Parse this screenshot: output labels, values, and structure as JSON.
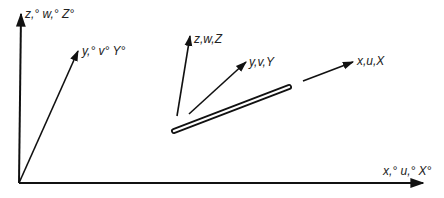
{
  "diagram": {
    "type": "coordinate-systems",
    "global_axes": {
      "z_label": "z,° w,° Z°",
      "y_label": "y,° v° Y°",
      "x_label": "x,° u,° X°"
    },
    "local_axes": {
      "z_label": "z,w,Z",
      "y_label": "y,v,Y",
      "x_label": "x,u,X"
    },
    "colors": {
      "stroke": "#111111",
      "text": "#222222",
      "background": "#ffffff"
    }
  }
}
